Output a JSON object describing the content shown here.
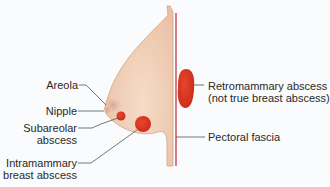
{
  "diagram": {
    "labels": {
      "areola": "Areola",
      "nipple": "Nipple",
      "subareolar_1": "Subareolar",
      "subareolar_2": "abscess",
      "intramammary_1": "Intramammary",
      "intramammary_2": "breast abscess",
      "retromammary_1": "Retromammary abscess",
      "retromammary_2": "(not true breast abscess)",
      "pectoral": "Pectoral fascia"
    },
    "colors": {
      "skin": "#f2d3bd",
      "skin_edge": "#d9a98c",
      "abscess": "#d8321f",
      "fascia": "#c0394a",
      "leader": "#555555"
    }
  }
}
